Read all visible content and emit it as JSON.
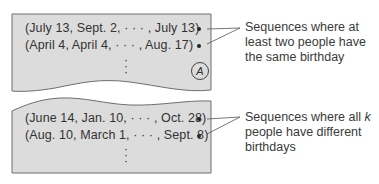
{
  "panel_a": {
    "sequences": [
      "(July 13, Sept. 2,  · · ·  , July 13)",
      "(April 4, April 4,  · · ·  , Aug. 17)"
    ],
    "continuation": "⋮",
    "badge": "A",
    "label": "Sequences where at least two people have the same birthday"
  },
  "panel_b": {
    "sequences": [
      "(June 14, Jan. 10, · · · , Oct. 28)",
      "(Aug. 10, March 1, · · · , Sept. 8)"
    ],
    "continuation": "⋮",
    "label_prefix": "Sequences where all ",
    "label_var": "k",
    "label_suffix": " people have different birthdays"
  },
  "colors": {
    "panel_fill": "#dcdcdc",
    "panel_stroke": "#6e6e6e",
    "text": "#333333"
  }
}
